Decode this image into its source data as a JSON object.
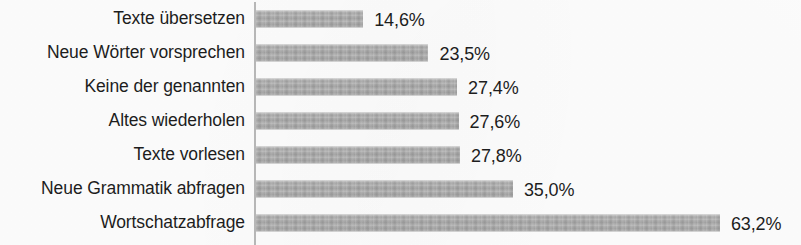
{
  "chart_data": {
    "type": "bar",
    "orientation": "horizontal",
    "title": "",
    "subtitle": "",
    "xlabel": "",
    "ylabel": "",
    "grid": false,
    "legend": "none",
    "axis_line": true,
    "value_suffix": "%",
    "decimal_separator": ",",
    "xlim": [
      0,
      63.2
    ],
    "categories": [
      "Texte übersetzen",
      "Neue Wörter vorsprechen",
      "Keine der genannten",
      "Altes wiederholen",
      "Texte vorlesen",
      "Neue Grammatik abfragen",
      "Wortschatzabfrage"
    ],
    "values": [
      14.6,
      23.5,
      27.4,
      27.6,
      27.8,
      35.0,
      63.2
    ],
    "value_labels": [
      "14,6%",
      "23,5%",
      "27,4%",
      "27,6%",
      "27,8%",
      "35,0%",
      "63,2%"
    ],
    "series": [
      {
        "name": "Anteil",
        "values": [
          14.6,
          23.5,
          27.4,
          27.6,
          27.8,
          35.0,
          63.2
        ]
      }
    ],
    "colors": {
      "bar": "#a9a9a9",
      "text": "#1d1d1d",
      "axis": "#b9b9b9",
      "background": "#fdfdfd"
    },
    "bars": [
      {
        "category": "Texte übersetzen",
        "value": 14.6,
        "label": "14,6%"
      },
      {
        "category": "Neue Wörter vorsprechen",
        "value": 23.5,
        "label": "23,5%"
      },
      {
        "category": "Keine der genannten",
        "value": 27.4,
        "label": "27,4%"
      },
      {
        "category": "Altes wiederholen",
        "value": 27.6,
        "label": "27,6%"
      },
      {
        "category": "Texte vorlesen",
        "value": 27.8,
        "label": "27,8%"
      },
      {
        "category": "Neue Grammatik abfragen",
        "value": 35.0,
        "label": "35,0%"
      },
      {
        "category": "Wortschatzabfrage",
        "value": 63.2,
        "label": "63,2%"
      }
    ]
  },
  "layout": {
    "px_per_percent": 7.34,
    "bar_height_px": 17,
    "row_height_px": 34,
    "first_row_top_px": 2,
    "axis_x_px": 254,
    "bar_origin_x_px": 256
  }
}
